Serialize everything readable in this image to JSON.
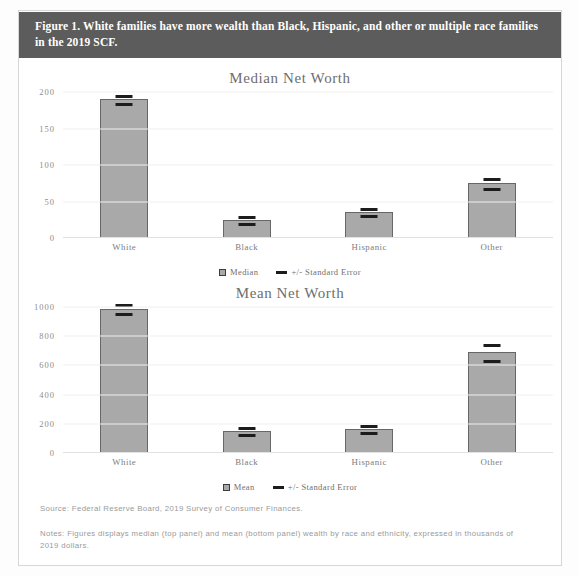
{
  "figure": {
    "header_title": "Figure 1. White families have more wealth than Black, Hispanic, and other or multiple race families in the 2019 SCF.",
    "source": "Source: Federal Reserve Board, 2019 Survey of Consumer Finances.",
    "notes": "Notes: Figures displays median (top panel) and mean (bottom panel) wealth by race and ethnicity, expressed in thousands of 2019 dollars.",
    "colors": {
      "header_band": "#5c5c5c",
      "bar_fill": "#a9a9a9",
      "bar_border": "#676767",
      "error_bar": "#1c1c1c",
      "gridline": "#efefef",
      "tick_text": "#8d8d8d"
    }
  },
  "chart_data": [
    {
      "type": "bar",
      "title": "Median Net Worth",
      "xlabel": "",
      "ylabel": "",
      "ylim": [
        0,
        200
      ],
      "yticks": [
        0,
        50,
        100,
        150,
        200
      ],
      "ytick_labels": [
        "0",
        "50",
        "100",
        "150",
        "200"
      ],
      "grid": true,
      "legend_position": "bottom",
      "categories": [
        "White",
        "Black",
        "Hispanic",
        "Other"
      ],
      "series": [
        {
          "name": "Median",
          "values": [
            190,
            24,
            36,
            75
          ]
        }
      ],
      "errors": [
        3,
        2,
        3,
        5
      ],
      "legend": [
        {
          "label": "Median",
          "marker": "bar-swatch-icon"
        },
        {
          "label": "+/- Standard Error",
          "marker": "error-bar-icon"
        }
      ]
    },
    {
      "type": "bar",
      "title": "Mean Net Worth",
      "xlabel": "",
      "ylabel": "",
      "ylim": [
        0,
        1000
      ],
      "yticks": [
        0,
        200,
        400,
        600,
        800,
        1000
      ],
      "ytick_labels": [
        "0",
        "200",
        "400",
        "600",
        "800",
        "1000"
      ],
      "grid": true,
      "legend_position": "bottom",
      "categories": [
        "White",
        "Black",
        "Hispanic",
        "Other"
      ],
      "series": [
        {
          "name": "Mean",
          "values": [
            985,
            150,
            165,
            690
          ]
        }
      ],
      "errors": [
        20,
        12,
        14,
        45
      ],
      "legend": [
        {
          "label": "Mean",
          "marker": "bar-swatch-icon"
        },
        {
          "label": "+/- Standard Error",
          "marker": "error-bar-icon"
        }
      ]
    }
  ]
}
